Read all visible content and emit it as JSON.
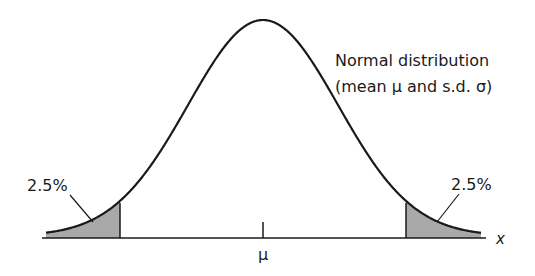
{
  "chart_data": {
    "type": "area",
    "title": "Normal distribution",
    "subtitle": "(mean μ and s.d. σ)",
    "xlabel": "x",
    "ylabel": "",
    "x_tick_labels": [
      "μ"
    ],
    "annotations": [
      {
        "text": "2.5%",
        "region": "left tail",
        "bound": "μ - 1.96σ"
      },
      {
        "text": "2.5%",
        "region": "right tail",
        "bound": "μ + 1.96σ"
      }
    ],
    "distribution": {
      "kind": "normal",
      "mean": "μ",
      "sd": "σ"
    },
    "shaded_tails": {
      "lower_z": -1.96,
      "upper_z": 1.96,
      "tail_percent_each": 2.5
    },
    "grid": false,
    "legend": "none",
    "colors": {
      "curve": "#1a1a1a",
      "shade": "#a9a9a9",
      "axis": "#1a1a1a"
    }
  },
  "labels": {
    "title_line1": "Normal distribution",
    "title_line2": "(mean μ and s.d. σ)",
    "left_tail": "2.5%",
    "right_tail": "2.5%",
    "mean_tick": "μ",
    "x_axis": "x"
  }
}
